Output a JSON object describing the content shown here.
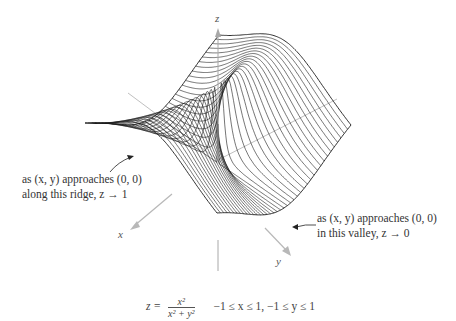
{
  "figure": {
    "axes": {
      "x_label": "x",
      "y_label": "y",
      "z_label": "z"
    },
    "annotations": {
      "ridge_line1": "as (x, y) approaches (0, 0)",
      "ridge_line2": "along this ridge, z → 1",
      "valley_line1": "as (x, y) approaches (0, 0)",
      "valley_line2": "in this valley, z → 0"
    },
    "caption": {
      "lhs": "z =",
      "numerator": "x²",
      "denominator": "x² + y²",
      "domain": "−1 ≤ x ≤ 1, −1 ≤ y ≤ 1"
    },
    "surface": {
      "function": "x^2/(x^2+y^2)",
      "x_range": [
        -1,
        1
      ],
      "y_range": [
        -1,
        1
      ],
      "curve_count": 40,
      "line_color": "#1a1a1a",
      "axis_color": "#b8b8b8"
    }
  }
}
